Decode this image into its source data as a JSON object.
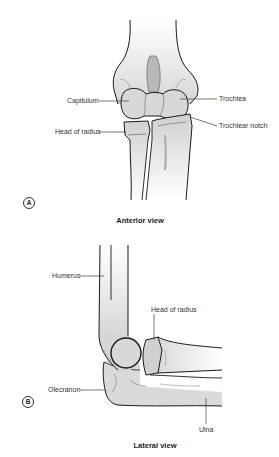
{
  "figure": {
    "panel_a": {
      "marker": "A",
      "caption": "Anterior view",
      "labels": {
        "capitulum": "Capitulum",
        "trochlea": "Trochlea",
        "trochlear_notch": "Trochlear notch",
        "head_of_radius": "Head of radius"
      }
    },
    "panel_b": {
      "marker": "B",
      "caption": "Lateral view",
      "labels": {
        "humerus": "Humerus",
        "head_of_radius": "Head of radius",
        "olecranon": "Olecranon",
        "ulna": "Ulna"
      }
    },
    "colors": {
      "bone_fill": "#d9d9d9",
      "bone_shade": "#b5b5b5",
      "outline": "#1a1a1a",
      "leader": "#444444"
    }
  }
}
